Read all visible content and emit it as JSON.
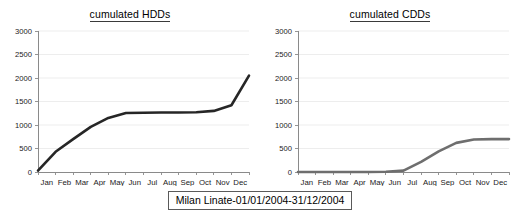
{
  "caption": "Milan Linate-01/01/2004-31/12/2004",
  "axis": {
    "y_ticks": [
      "0",
      "500",
      "1000",
      "1500",
      "2000",
      "2500",
      "3000"
    ],
    "x_ticks": [
      "Jan",
      "Feb",
      "Mar",
      "Apr",
      "May",
      "Jun",
      "Jul",
      "Aug",
      "Sep",
      "Oct",
      "Nov",
      "Dec"
    ]
  },
  "colors": {
    "hdd_line": "#262626",
    "cdd_line": "#6e6e6e",
    "gridline": "#e9e9e9",
    "axis": "#8a8a8a",
    "text": "#1a1a1a"
  },
  "charts": [
    {
      "id": "hdd",
      "title": "cumulated HDDs"
    },
    {
      "id": "cdd",
      "title": "cumulated CDDs"
    }
  ],
  "chart_data": [
    {
      "type": "line",
      "title": "cumulated HDDs",
      "xlabel": "",
      "ylabel": "",
      "ylim": [
        0,
        3000
      ],
      "yticks": [
        0,
        500,
        1000,
        1500,
        2000,
        2500,
        3000
      ],
      "grid": true,
      "legend": "none",
      "categories": [
        "Jan",
        "Feb",
        "Mar",
        "Apr",
        "May",
        "Jun",
        "Jul",
        "Aug",
        "Sep",
        "Oct",
        "Nov",
        "Dec"
      ],
      "series": [
        {
          "name": "cumulated HDDs",
          "color": "#262626",
          "values": [
            30,
            430,
            700,
            960,
            1150,
            1255,
            1262,
            1265,
            1267,
            1270,
            1300,
            1420,
            2050
          ]
        }
      ],
      "x_fractional_positions": [
        0,
        0.0833,
        0.1667,
        0.25,
        0.3333,
        0.4167,
        0.5,
        0.5833,
        0.6667,
        0.75,
        0.8333,
        0.9167,
        1.0
      ],
      "notes": "Monotonic S-shape: steep rise Jan-May, flat plateau near 1260 from May to Oct, steep rise Nov-Dec ending ~2050"
    },
    {
      "type": "line",
      "title": "cumulated CDDs",
      "xlabel": "",
      "ylabel": "",
      "ylim": [
        0,
        3000
      ],
      "yticks": [
        0,
        500,
        1000,
        1500,
        2000,
        2500,
        3000
      ],
      "grid": true,
      "legend": "none",
      "categories": [
        "Jan",
        "Feb",
        "Mar",
        "Apr",
        "May",
        "Jun",
        "Jul",
        "Aug",
        "Sep",
        "Oct",
        "Nov",
        "Dec"
      ],
      "series": [
        {
          "name": "cumulated CDDs",
          "color": "#6e6e6e",
          "values": [
            0,
            0,
            0,
            0,
            0,
            5,
            30,
            215,
            440,
            620,
            690,
            700,
            700
          ]
        }
      ],
      "x_fractional_positions": [
        0,
        0.0833,
        0.1667,
        0.25,
        0.3333,
        0.4167,
        0.5,
        0.5833,
        0.6667,
        0.75,
        0.8333,
        0.9167,
        1.0
      ],
      "notes": "Flat at 0 from Jan through early Jun, rises Jun-Oct, plateaus near 700 from Oct to Dec"
    }
  ]
}
